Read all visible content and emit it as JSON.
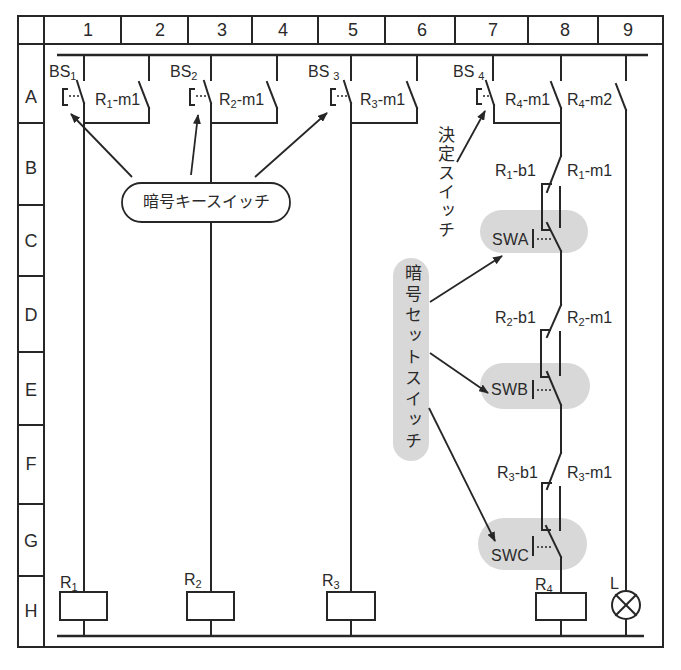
{
  "grid": {
    "columns": [
      "1",
      "2",
      "3",
      "4",
      "5",
      "6",
      "7",
      "8",
      "9"
    ],
    "rows": [
      "A",
      "B",
      "C",
      "D",
      "E",
      "F",
      "G",
      "H"
    ]
  },
  "key_switches": [
    {
      "base": "BS",
      "sub": "1"
    },
    {
      "base": "BS",
      "sub": "2"
    },
    {
      "base": "BS",
      "sub": "3"
    }
  ],
  "decision_switch": {
    "base": "BS",
    "sub": "4"
  },
  "self_hold_contacts": [
    {
      "base": "R",
      "sub": "1",
      "suffix": "-m1"
    },
    {
      "base": "R",
      "sub": "2",
      "suffix": "-m1"
    },
    {
      "base": "R",
      "sub": "3",
      "suffix": "-m1"
    },
    {
      "base": "R",
      "sub": "4",
      "suffix": "-m1"
    }
  ],
  "lamp_contact": {
    "base": "R",
    "sub": "4",
    "suffix": "-m2"
  },
  "chain": [
    {
      "b_contact": {
        "base": "R",
        "sub": "1",
        "suffix": "-b1"
      },
      "m_contact": {
        "base": "R",
        "sub": "1",
        "suffix": "-m1"
      },
      "set_switch": "SWA"
    },
    {
      "b_contact": {
        "base": "R",
        "sub": "2",
        "suffix": "-b1"
      },
      "m_contact": {
        "base": "R",
        "sub": "2",
        "suffix": "-m1"
      },
      "set_switch": "SWB"
    },
    {
      "b_contact": {
        "base": "R",
        "sub": "3",
        "suffix": "-b1"
      },
      "m_contact": {
        "base": "R",
        "sub": "3",
        "suffix": "-m1"
      },
      "set_switch": "SWC"
    }
  ],
  "relays": [
    {
      "base": "R",
      "sub": "1"
    },
    {
      "base": "R",
      "sub": "2"
    },
    {
      "base": "R",
      "sub": "3"
    },
    {
      "base": "R",
      "sub": "4"
    }
  ],
  "lamp": {
    "label": "L",
    "icon": "lamp-icon"
  },
  "callouts": {
    "key_switch": "暗号キースイッチ",
    "decision_switch": "決定スイッチ",
    "set_switch": "暗号セットスイッチ"
  },
  "colors": {
    "line": "#262626",
    "highlight": "#d8d8d8",
    "background": "#ffffff",
    "text": "#2a2a2a"
  }
}
